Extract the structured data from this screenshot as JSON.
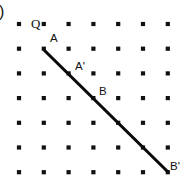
{
  "figure": {
    "panel_label": ")",
    "background_color": "#ffffff",
    "ink_color": "#111111",
    "width": 184,
    "height": 181,
    "lattice": {
      "name": "square-dot-lattice",
      "columns": 7,
      "rows": 7,
      "origin_x": 19,
      "origin_y": 24,
      "spacing_x": 24.8,
      "spacing_y": 24.7,
      "dot_size": 4.2
    },
    "ray": {
      "name": "ray-A-to-Bprime",
      "x1": 44,
      "y1": 50,
      "x2": 168,
      "y2": 172,
      "stroke_width": 3.1,
      "color": "#0a0a0a"
    },
    "labels": [
      {
        "text": "Q",
        "x": 31,
        "y": 28,
        "anchor": "start",
        "style": "serif"
      },
      {
        "text": "A",
        "x": 50,
        "y": 42,
        "anchor": "start",
        "style": "sans"
      },
      {
        "text": "A'",
        "x": 75,
        "y": 70,
        "anchor": "start",
        "style": "sans"
      },
      {
        "text": "B",
        "x": 99,
        "y": 95,
        "anchor": "start",
        "style": "sans"
      },
      {
        "text": "B'",
        "x": 170,
        "y": 170,
        "anchor": "start",
        "style": "sans"
      }
    ]
  }
}
